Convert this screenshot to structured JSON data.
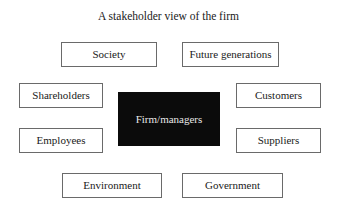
{
  "diagram": {
    "title": "A stakeholder view of the firm",
    "center": {
      "label": "Firm/managers",
      "fill": "#0b0b0b",
      "text_color": "#e8e8e8"
    },
    "stakeholders": [
      {
        "id": "society",
        "label": "Society"
      },
      {
        "id": "future-generations",
        "label": "Future generations"
      },
      {
        "id": "shareholders",
        "label": "Shareholders"
      },
      {
        "id": "customers",
        "label": "Customers"
      },
      {
        "id": "employees",
        "label": "Employees"
      },
      {
        "id": "suppliers",
        "label": "Suppliers"
      },
      {
        "id": "environment",
        "label": "Environment"
      },
      {
        "id": "government",
        "label": "Government"
      }
    ]
  }
}
